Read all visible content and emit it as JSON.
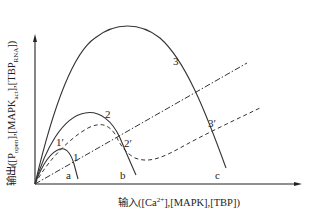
{
  "diagram": {
    "y_axis_label": {
      "prefix": "输出([P",
      "sub1": "open",
      "mid1": "],[MAPK",
      "sub2": "act",
      "mid2": "],[TBP",
      "sub3": "RNA",
      "suffix": "])"
    },
    "x_axis_label": {
      "prefix": "输入([Ca",
      "sup": "2+",
      "suffix": "],[MAPK],[TBP])"
    },
    "curve_labels": {
      "c1": "1",
      "c1p": "1′",
      "c2": "2",
      "c2p": "2′",
      "c3": "3",
      "c3p": "3′"
    },
    "x_points": {
      "a": "a",
      "b": "b",
      "c": "c"
    },
    "colors": {
      "line": "#333333",
      "axis": "#222222"
    }
  }
}
